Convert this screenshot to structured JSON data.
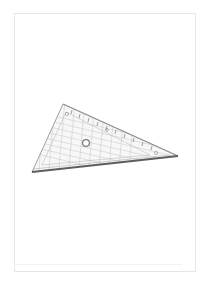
{
  "image": {
    "subject": "set-square-ruler",
    "description": "Transparent plastic set square (triangle ruler) with measurement scale, on a blank white page",
    "ruler_scale_labels": [
      "1",
      "2",
      "3",
      "4",
      "5",
      "6",
      "7",
      "8",
      "9"
    ],
    "colors": {
      "background": "#ffffff",
      "page_border": "#e6e6e6",
      "ruler_edge": "#6f6f6f",
      "ruler_grid": "#b5b5b5"
    }
  }
}
